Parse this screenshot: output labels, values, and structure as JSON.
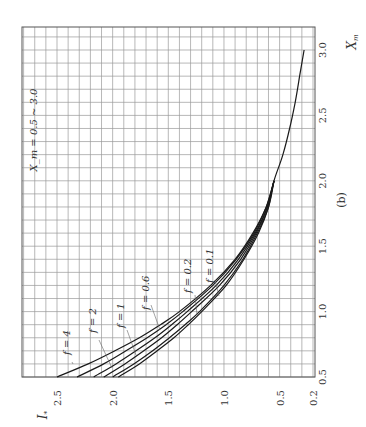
{
  "figure": {
    "panel_label": "(b)",
    "range_annotation": "X_m = 0.5 ~ 3.0",
    "orientation": "rotated 90° counter-clockwise"
  },
  "chart_data": {
    "type": "line",
    "title": "",
    "panel": "(b)",
    "xlabel": "X_m",
    "ylabel": "I_*",
    "xlim": [
      0.5,
      3.0
    ],
    "ylim": [
      0.2,
      2.5
    ],
    "x_ticks": [
      0.5,
      1.0,
      1.5,
      2.0,
      2.5,
      3.0
    ],
    "x_tick_labels": [
      "0.5",
      "1.0",
      "1.5",
      "2.0",
      "2.5",
      "3.0"
    ],
    "y_ticks": [
      0.2,
      0.5,
      1.0,
      1.5,
      2.0,
      2.5
    ],
    "y_tick_labels": [
      "0.2",
      "0.5",
      "1.0",
      "1.5",
      "2.0",
      "2.5"
    ],
    "grid": true,
    "grid_minor_step_x": 0.1,
    "grid_minor_step_y": 0.1,
    "legend": "inline labels",
    "annotation": "X_m = 0.5 ~ 3.0",
    "series": [
      {
        "name": "f = 4",
        "x": [
          0.5,
          0.6,
          0.7,
          0.8,
          0.9,
          1.0,
          1.2,
          1.4,
          1.6,
          1.8,
          2.0
        ],
        "y": [
          2.5,
          2.22,
          1.98,
          1.76,
          1.57,
          1.4,
          1.12,
          0.9,
          0.74,
          0.62,
          0.55
        ]
      },
      {
        "name": "f = 2",
        "x": [
          0.5,
          0.6,
          0.7,
          0.8,
          0.9,
          1.0,
          1.2,
          1.4,
          1.6,
          1.8,
          2.0
        ],
        "y": [
          2.32,
          2.08,
          1.88,
          1.69,
          1.52,
          1.37,
          1.1,
          0.89,
          0.73,
          0.62,
          0.55
        ]
      },
      {
        "name": "f = 1",
        "x": [
          0.5,
          0.6,
          0.7,
          0.8,
          0.9,
          1.0,
          1.2,
          1.4,
          1.6,
          1.8,
          2.0
        ],
        "y": [
          2.17,
          1.97,
          1.79,
          1.62,
          1.47,
          1.33,
          1.07,
          0.87,
          0.72,
          0.61,
          0.55
        ]
      },
      {
        "name": "f = 0.6",
        "x": [
          0.5,
          0.6,
          0.7,
          0.8,
          0.9,
          1.0,
          1.2,
          1.4,
          1.6,
          1.8,
          2.0
        ],
        "y": [
          2.08,
          1.89,
          1.72,
          1.56,
          1.42,
          1.29,
          1.04,
          0.85,
          0.71,
          0.61,
          0.55
        ]
      },
      {
        "name": "f = 0.2",
        "x": [
          0.5,
          0.6,
          0.7,
          0.8,
          0.9,
          1.0,
          1.2,
          1.4,
          1.6,
          1.8,
          2.0
        ],
        "y": [
          2.0,
          1.81,
          1.64,
          1.49,
          1.35,
          1.22,
          1.0,
          0.83,
          0.7,
          0.6,
          0.55
        ]
      },
      {
        "name": "f = 0.1",
        "x": [
          0.5,
          0.6,
          0.7,
          0.8,
          0.9,
          1.0,
          1.2,
          1.4,
          1.6,
          1.8,
          2.0,
          2.2,
          2.4,
          2.6,
          2.8,
          3.0
        ],
        "y": [
          1.95,
          1.76,
          1.6,
          1.45,
          1.32,
          1.2,
          0.98,
          0.82,
          0.69,
          0.6,
          0.55,
          0.47,
          0.41,
          0.36,
          0.32,
          0.28
        ]
      }
    ]
  },
  "labels": {
    "curve_labels": [
      "f = 4",
      "f = 2",
      "f = 1",
      "f = 0.6",
      "f = 0.2",
      "f = 0.1"
    ],
    "x_axis_name": "X",
    "x_axis_sub": "m",
    "y_axis_name": "I",
    "y_axis_sub": "*"
  }
}
